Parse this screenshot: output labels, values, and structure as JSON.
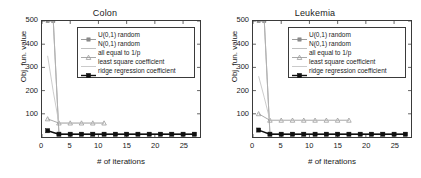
{
  "figure": {
    "background": "#ffffff",
    "panels": [
      {
        "id": "colon",
        "title": "Colon"
      },
      {
        "id": "leukemia",
        "title": "Leukemia"
      }
    ]
  },
  "chart_data": [
    {
      "type": "line",
      "title": "Colon",
      "xlabel": "# of iterations",
      "ylabel": "Obj. fun. value",
      "xlim": [
        0,
        28
      ],
      "ylim": [
        0,
        500
      ],
      "xticks": [
        0,
        5,
        10,
        15,
        20,
        25
      ],
      "yticks": [
        100,
        200,
        300,
        400,
        500
      ],
      "grid": false,
      "legend_position": "upper right",
      "series": [
        {
          "name": "U(0,1) random",
          "color": "#8a8a8a",
          "marker": "square",
          "x": [
            1,
            2,
            3,
            5,
            7,
            9,
            11,
            13,
            15,
            17,
            19,
            21,
            23,
            25,
            27
          ],
          "values": [
            500,
            500,
            14,
            13,
            13,
            13,
            13,
            13,
            13,
            13,
            13,
            13,
            13,
            13,
            13
          ]
        },
        {
          "name": "N(0,1) random",
          "color": "#b5b5b5",
          "marker": "none",
          "x": [
            1,
            2,
            3,
            5,
            7,
            9,
            11,
            13,
            15,
            17,
            19,
            21,
            23,
            25,
            27
          ],
          "values": [
            500,
            500,
            14,
            13,
            13,
            13,
            13,
            13,
            13,
            13,
            13,
            13,
            13,
            13,
            13
          ]
        },
        {
          "name": "all equal to 1/p",
          "color": "#9a9a9a",
          "marker": "triangle",
          "x": [
            1,
            3,
            5,
            7,
            9,
            11
          ],
          "values": [
            78,
            60,
            60,
            60,
            60,
            60
          ]
        },
        {
          "name": "least square coefficient",
          "color": "#c2c2c2",
          "marker": "none",
          "x": [
            1,
            2,
            3,
            5,
            7,
            9,
            11
          ],
          "values": [
            350,
            195,
            60,
            60,
            60,
            60,
            60
          ]
        },
        {
          "name": "ridge regression coefficient",
          "color": "#101010",
          "marker": "square-filled",
          "x": [
            1,
            3,
            5,
            7,
            9,
            11,
            13,
            15,
            17,
            19,
            21,
            23,
            25,
            27
          ],
          "values": [
            27,
            12,
            12,
            12,
            12,
            12,
            12,
            12,
            12,
            12,
            12,
            12,
            12,
            12
          ]
        }
      ]
    },
    {
      "type": "line",
      "title": "Leukemia",
      "xlabel": "# of iterations",
      "ylabel": "Obj. fun. value",
      "xlim": [
        0,
        28
      ],
      "ylim": [
        0,
        500
      ],
      "xticks": [
        0,
        5,
        10,
        15,
        20,
        25
      ],
      "yticks": [
        100,
        200,
        300,
        400,
        500
      ],
      "grid": false,
      "legend_position": "upper right",
      "series": [
        {
          "name": "U(0,1) random",
          "color": "#8a8a8a",
          "marker": "square",
          "x": [
            1,
            2,
            3,
            5,
            7,
            9,
            11,
            13,
            15,
            17,
            19,
            21,
            23,
            25,
            27
          ],
          "values": [
            500,
            500,
            14,
            13,
            13,
            13,
            13,
            13,
            13,
            13,
            13,
            13,
            13,
            13,
            13
          ]
        },
        {
          "name": "N(0,1) random",
          "color": "#b5b5b5",
          "marker": "none",
          "x": [
            1,
            2,
            3,
            5,
            7,
            9,
            11,
            13,
            15,
            17,
            19,
            21,
            23,
            25,
            27
          ],
          "values": [
            500,
            500,
            14,
            13,
            13,
            13,
            13,
            13,
            13,
            13,
            13,
            13,
            13,
            13,
            13
          ]
        },
        {
          "name": "all equal to 1/p",
          "color": "#9a9a9a",
          "marker": "triangle",
          "x": [
            1,
            3,
            5,
            7,
            9,
            11,
            13,
            15,
            17
          ],
          "values": [
            100,
            72,
            72,
            72,
            72,
            72,
            72,
            72,
            72
          ]
        },
        {
          "name": "least square coefficient",
          "color": "#c2c2c2",
          "marker": "none",
          "x": [
            1,
            2,
            3,
            5,
            7,
            9,
            11,
            13,
            15,
            17
          ],
          "values": [
            262,
            170,
            72,
            72,
            72,
            72,
            72,
            72,
            72,
            72
          ]
        },
        {
          "name": "ridge regression coefficient",
          "color": "#101010",
          "marker": "square-filled",
          "x": [
            1,
            3,
            5,
            7,
            9,
            11,
            13,
            15,
            17,
            19,
            21,
            23,
            25,
            27
          ],
          "values": [
            30,
            12,
            12,
            12,
            12,
            12,
            12,
            12,
            12,
            12,
            12,
            12,
            12,
            12
          ]
        }
      ]
    }
  ]
}
